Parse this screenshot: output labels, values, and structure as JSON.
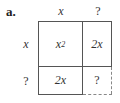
{
  "part_label": "a.",
  "col_headers": [
    "x",
    "?"
  ],
  "row_headers": [
    "x",
    "?"
  ],
  "cells": {
    "top_left": {
      "base": "x",
      "exp": "2"
    },
    "top_right": "2x",
    "bottom_left": "2x",
    "bottom_right": "?"
  },
  "colors": {
    "line": "#555555",
    "dashed_line": "#888888",
    "text": "#333333"
  }
}
